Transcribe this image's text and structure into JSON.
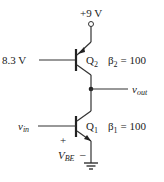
{
  "diagram": {
    "type": "circuit",
    "supply": {
      "label": "+9 V"
    },
    "q2": {
      "name": "Q",
      "sub": "2",
      "kind": "PNP",
      "beta_symbol": "β",
      "beta_sub": "2",
      "beta_value": "= 100",
      "base_voltage": "8.3 V"
    },
    "q1": {
      "name": "Q",
      "sub": "1",
      "kind": "NPN",
      "beta_symbol": "β",
      "beta_sub": "1",
      "beta_value": "= 100"
    },
    "vout": {
      "main": "v",
      "sub": "out"
    },
    "vin": {
      "main": "v",
      "sub": "in"
    },
    "vbe": {
      "main": "V",
      "sub": "BE",
      "plus": "+",
      "minus": "–"
    },
    "ground": "ground"
  }
}
